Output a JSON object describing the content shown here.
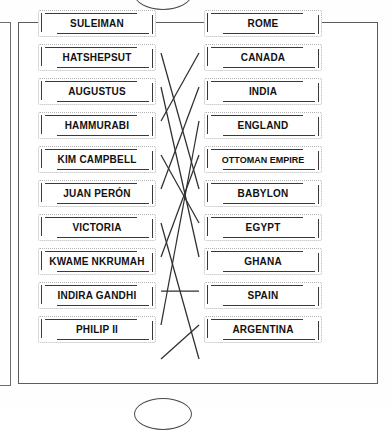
{
  "worksheet": {
    "type": "matching-exercise",
    "title_visible": false,
    "left_column_heading": "",
    "right_column_heading": "",
    "left_items": [
      {
        "id": "L1",
        "label": "SULEIMAN"
      },
      {
        "id": "L2",
        "label": "HATSHEPSUT"
      },
      {
        "id": "L3",
        "label": "AUGUSTUS"
      },
      {
        "id": "L4",
        "label": "HAMMURABI"
      },
      {
        "id": "L5",
        "label": "KIM CAMPBELL"
      },
      {
        "id": "L6",
        "label": "JUAN PERÓN"
      },
      {
        "id": "L7",
        "label": "VICTORIA"
      },
      {
        "id": "L8",
        "label": "KWAME NKRUMAH"
      },
      {
        "id": "L9",
        "label": "INDIRA GANDHI"
      },
      {
        "id": "L10",
        "label": "PHILIP II"
      }
    ],
    "right_items": [
      {
        "id": "R1",
        "label": "ROME"
      },
      {
        "id": "R2",
        "label": "CANADA"
      },
      {
        "id": "R3",
        "label": "INDIA"
      },
      {
        "id": "R4",
        "label": "ENGLAND"
      },
      {
        "id": "R5",
        "label": "OTTOMAN EMPIRE"
      },
      {
        "id": "R6",
        "label": "BABYLON"
      },
      {
        "id": "R7",
        "label": "EGYPT"
      },
      {
        "id": "R8",
        "label": "GHANA"
      },
      {
        "id": "R9",
        "label": "SPAIN"
      },
      {
        "id": "R10",
        "label": "ARGENTINA"
      }
    ],
    "connections": [
      {
        "from": "L1",
        "to": "R5"
      },
      {
        "from": "L2",
        "to": "R7"
      },
      {
        "from": "L3",
        "to": "R1"
      },
      {
        "from": "L4",
        "to": "R6"
      },
      {
        "from": "L5",
        "to": "R2"
      },
      {
        "from": "L6",
        "to": "R10"
      },
      {
        "from": "L7",
        "to": "R4"
      },
      {
        "from": "L8",
        "to": "R8"
      },
      {
        "from": "L9",
        "to": "R3"
      },
      {
        "from": "L10",
        "to": "R9"
      }
    ],
    "colors": {
      "ink": "#111111",
      "line": "#2f2f2f",
      "card_border": "#b4b4b4",
      "frame": "#5c5c5c",
      "paper": "#ffffff"
    }
  }
}
